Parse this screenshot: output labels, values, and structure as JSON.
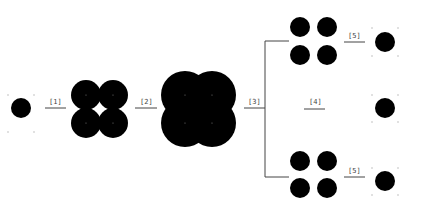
{
  "diagram": {
    "title": "",
    "colors": {
      "blob": "#000000",
      "line": "#444444",
      "dot": "#bbbbbb",
      "background": "#ffffff"
    },
    "steps": [
      {
        "id": "step1",
        "label": "[1]"
      },
      {
        "id": "step2",
        "label": "[2]"
      },
      {
        "id": "step3",
        "label": "[3]"
      },
      {
        "id": "step4",
        "label": "[4]"
      },
      {
        "id": "step5a",
        "label": "[5]"
      },
      {
        "id": "step5b",
        "label": "[5]"
      }
    ],
    "nodes": [
      {
        "id": "single-start",
        "shape": "single circle with corner marks"
      },
      {
        "id": "merged-small",
        "shape": "four overlapping circles"
      },
      {
        "id": "merged-large",
        "shape": "four heavily overlapping circles"
      },
      {
        "id": "branch-top-group",
        "shape": "four separate circles"
      },
      {
        "id": "branch-middle-empty",
        "shape": "empty"
      },
      {
        "id": "branch-bottom-group",
        "shape": "four separate circles"
      },
      {
        "id": "result-top",
        "shape": "single circle with corner marks"
      },
      {
        "id": "result-middle",
        "shape": "single circle with corner marks"
      },
      {
        "id": "result-bottom",
        "shape": "single circle with corner marks"
      }
    ]
  }
}
